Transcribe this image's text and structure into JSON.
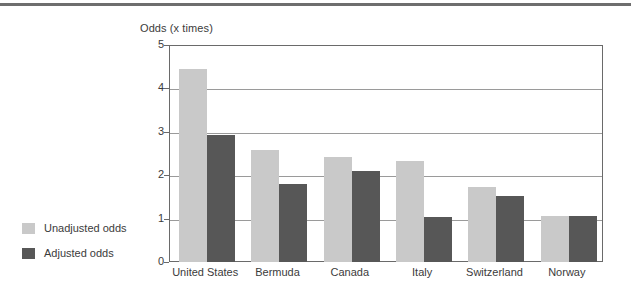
{
  "chart_data": {
    "type": "bar",
    "title": "",
    "subtitle": "",
    "xlabel": "",
    "ylabel": "Odds (x times)",
    "ylim": [
      0,
      5
    ],
    "yticks": [
      0,
      1,
      2,
      3,
      4,
      5
    ],
    "ytick_labels": [
      "0",
      "1",
      "2",
      "3",
      "4",
      "5"
    ],
    "grid": true,
    "legend_position": "left-outside",
    "categories": [
      "United States",
      "Bermuda",
      "Canada",
      "Italy",
      "Switzerland",
      "Norway"
    ],
    "series": [
      {
        "name": "Unadjusted odds",
        "color": "#c9c9c9",
        "values": [
          4.45,
          2.57,
          2.43,
          2.32,
          1.72,
          1.05
        ]
      },
      {
        "name": "Adjusted odds",
        "color": "#575757",
        "values": [
          2.93,
          1.8,
          2.1,
          1.03,
          1.53,
          1.06
        ]
      }
    ]
  },
  "legend": {
    "items": [
      {
        "label": "Unadjusted odds",
        "color": "#c9c9c9"
      },
      {
        "label": "Adjusted odds",
        "color": "#575757"
      }
    ]
  },
  "colors": {
    "unadjusted": "#c9c9c9",
    "adjusted": "#575757",
    "axis": "#6a6a6a",
    "grid": "#9a9a9a",
    "rule": "#6e6e6e",
    "text": "#3b3b3b"
  }
}
